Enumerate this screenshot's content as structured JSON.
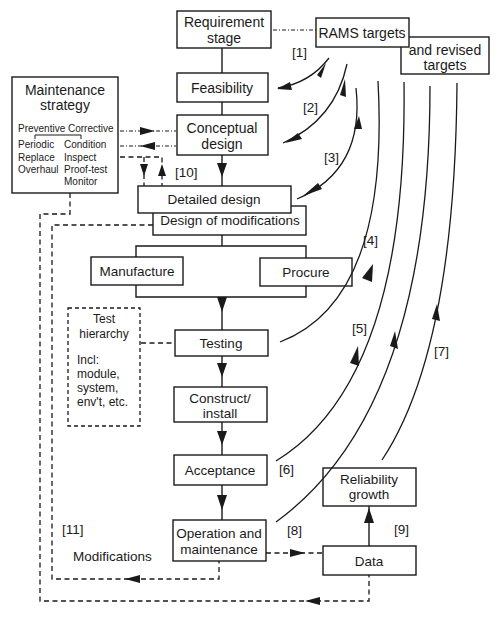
{
  "boxes": {
    "requirement": [
      "Requirement",
      "stage"
    ],
    "feasibility": "Feasibility",
    "conceptual": [
      "Conceptual",
      "design"
    ],
    "detailed": "Detailed design",
    "modifications_design": "Design of modifications",
    "manufacture": "Manufacture",
    "procure": "Procure",
    "testing": "Testing",
    "construct": [
      "Construct/",
      "install"
    ],
    "acceptance": "Acceptance",
    "operation": [
      "Operation and",
      "maintenance"
    ],
    "data": "Data",
    "reliability": [
      "Reliability",
      "growth"
    ],
    "rams": "RAMS targets",
    "revised": [
      "and revised",
      "targets"
    ]
  },
  "maintenance_strategy": {
    "title": [
      "Maintenance",
      "strategy"
    ],
    "preventive": {
      "label": "Preventive",
      "items": [
        "Periodic",
        "Replace",
        "Overhaul"
      ]
    },
    "corrective": {
      "label": "Corrective",
      "items": [
        "Condition",
        "Inspect",
        "Proof-test",
        "Monitor"
      ]
    }
  },
  "test_hierarchy": {
    "title": [
      "Test",
      "hierarchy"
    ],
    "incl": [
      "Incl:",
      "module,",
      "system,",
      "env't, etc."
    ]
  },
  "labels": {
    "l1": "[1]",
    "l2": "[2]",
    "l3": "[3]",
    "l4": "[4]",
    "l5": "[5]",
    "l6": "[6]",
    "l7": "[7]",
    "l8": "[8]",
    "l9": "[9]",
    "l10": "[10]",
    "l11": "[11]",
    "modifications": "Modifications"
  },
  "colors": {
    "ink": "#1a1a1a",
    "background": "#ffffff"
  }
}
